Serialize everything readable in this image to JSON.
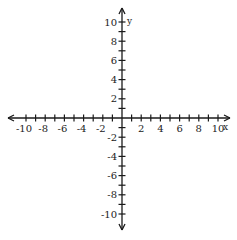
{
  "chart_data": {
    "type": "scatter",
    "title": "",
    "xlabel": "x",
    "ylabel": "y",
    "xlim": [
      -10,
      10
    ],
    "ylim": [
      -10,
      10
    ],
    "x_tick_step": 1,
    "y_tick_step": 1,
    "x_tick_labels": [
      "-10",
      "-8",
      "-6",
      "-4",
      "-2",
      "2",
      "4",
      "6",
      "8",
      "10"
    ],
    "y_tick_labels": [
      "10",
      "8",
      "6",
      "4",
      "2",
      "-2",
      "-4",
      "-6",
      "-8",
      "-10"
    ],
    "grid": false,
    "series": [],
    "arrows": "both ends on both axes"
  },
  "axes": {
    "x_label": "x",
    "y_label": "y"
  },
  "colors": {
    "axis": "#1a1a1a",
    "text": "#222222",
    "background": "#ffffff"
  }
}
